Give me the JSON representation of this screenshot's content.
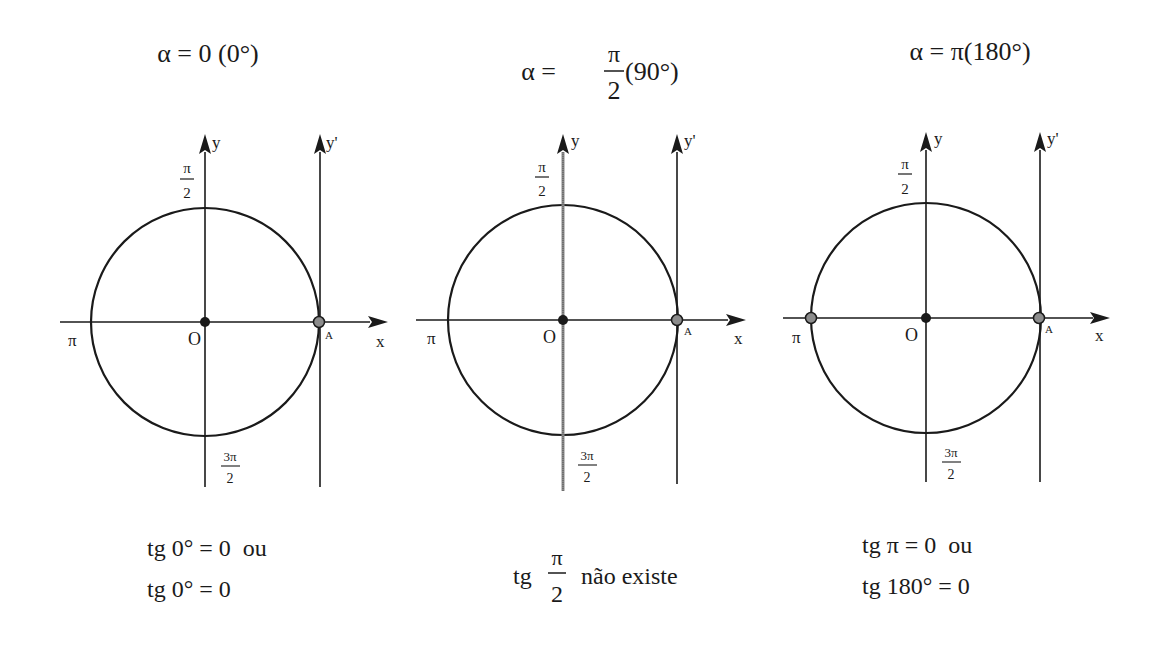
{
  "panels": [
    {
      "id": "alpha-0",
      "title": {
        "lhs": "α = 0 (0°)"
      },
      "axes": {
        "x": "x",
        "y": "y",
        "y_prime": "y'"
      },
      "labels": {
        "origin": "O",
        "point_a": "A",
        "left": "π",
        "top_num": "π",
        "top_den": "2",
        "bottom_num": "3π",
        "bottom_den": "2"
      },
      "result": {
        "line1": "tg 0° = 0  ou",
        "line2": "tg 0° = 0"
      },
      "highlight_pi_point": false,
      "y_axis_grey": false
    },
    {
      "id": "alpha-pi-2",
      "title": {
        "prefix": "α =",
        "num": "π",
        "den": "2",
        "suffix": "(90°)"
      },
      "axes": {
        "x": "x",
        "y": "y",
        "y_prime": "y'"
      },
      "labels": {
        "origin": "O",
        "point_a": "A",
        "left": "π",
        "top_num": "π",
        "top_den": "2",
        "bottom_num": "3π",
        "bottom_den": "2"
      },
      "result": {
        "prefix": "tg",
        "num": "π",
        "den": "2",
        "suffix": "não existe"
      },
      "highlight_pi_point": false,
      "y_axis_grey": true
    },
    {
      "id": "alpha-pi",
      "title": {
        "lhs": "α = π(180°)"
      },
      "axes": {
        "x": "x",
        "y": "y",
        "y_prime": "y'"
      },
      "labels": {
        "origin": "O",
        "point_a": "A",
        "left": "π",
        "top_num": "π",
        "top_den": "2",
        "bottom_num": "3π",
        "bottom_den": "2"
      },
      "result": {
        "line1": "tg π = 0  ou",
        "line2": "tg 180° = 0"
      },
      "highlight_pi_point": true,
      "y_axis_grey": false
    }
  ],
  "colors": {
    "ink": "#1a1a1a",
    "point_fill": "#8c8c8c",
    "grey_axis": "#777777",
    "background": "#ffffff"
  }
}
